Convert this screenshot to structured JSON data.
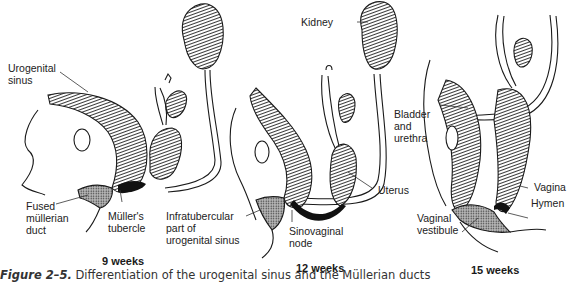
{
  "figure": {
    "number": "Figure 2–5.",
    "caption_text": " Differentiation of the urogenital sinus and the Müllerian ducts",
    "panels": [
      {
        "stage": "9 weeks",
        "labels": {
          "urogenital_sinus": "Urogenital\nsinus",
          "fused_mullerian_duct": "Fused\nmüllerian\nduct",
          "mullers_tubercle": "Müller's\ntubercle"
        }
      },
      {
        "stage": "12 weeks",
        "labels": {
          "kidney": "Kidney",
          "infratubercular": "Infratubercular\npart of\nurogenital sinus",
          "sinovaginal_node": "Sinovaginal\nnode",
          "uterus": "Uterus"
        }
      },
      {
        "stage": "15 weeks",
        "labels": {
          "bladder_urethra": "Bladder\nand\nurethra",
          "vagina": "Vagina",
          "hymen": "Hymen",
          "vaginal_vestibule": "Vaginal\nvestibule"
        }
      }
    ]
  }
}
